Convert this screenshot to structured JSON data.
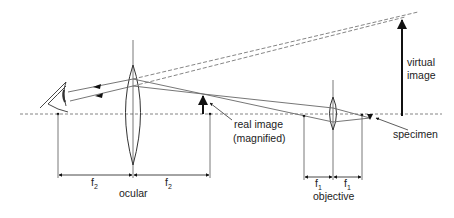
{
  "colors": {
    "line": "#555555",
    "ray": "#666666",
    "arrow": "#111111",
    "text": "#222222",
    "background": "#ffffff"
  },
  "labels": {
    "virtual_image_line1": "virtual",
    "virtual_image_line2": "image",
    "real_image_line1": "real image",
    "real_image_line2": "(magnified)",
    "specimen": "specimen",
    "ocular": "ocular",
    "objective": "objective",
    "f2_left": "f",
    "f2_left_sub": "2",
    "f2_right": "f",
    "f2_right_sub": "2",
    "f1_left": "f",
    "f1_left_sub": "1",
    "f1_right": "f",
    "f1_right_sub": "1"
  },
  "elements": {
    "optical_axis": "dashed horizontal line",
    "ocular_lens": "large biconvex lens",
    "objective_lens": "small biconvex lens",
    "eye": "eye-icon",
    "real_image": "upward arrow",
    "virtual_image": "tall upward arrow",
    "specimen_marker": "small downward arrow"
  }
}
